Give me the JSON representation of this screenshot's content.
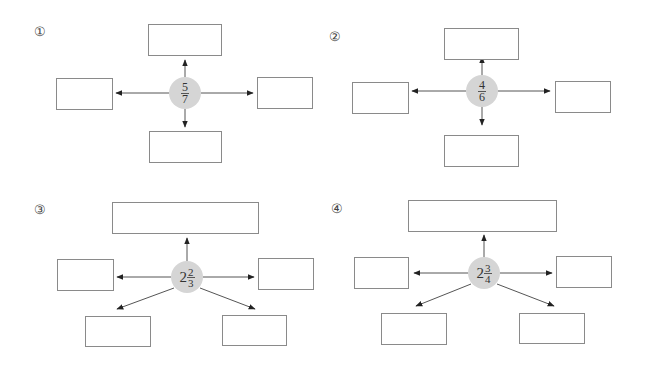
{
  "diagrams": [
    {
      "label": "①",
      "center": {
        "whole": "",
        "numerator": "5",
        "denominator": "7"
      },
      "boxes": [
        "",
        "",
        "",
        ""
      ],
      "layout": "cross"
    },
    {
      "label": "②",
      "center": {
        "whole": "",
        "numerator": "4",
        "denominator": "6"
      },
      "boxes": [
        "",
        "",
        "",
        ""
      ],
      "layout": "cross"
    },
    {
      "label": "③",
      "center": {
        "whole": "2",
        "numerator": "2",
        "denominator": "3"
      },
      "boxes": [
        "",
        "",
        "",
        "",
        ""
      ],
      "layout": "star"
    },
    {
      "label": "④",
      "center": {
        "whole": "2",
        "numerator": "3",
        "denominator": "4"
      },
      "boxes": [
        "",
        "",
        "",
        "",
        ""
      ],
      "layout": "star"
    }
  ],
  "colors": {
    "hub_fill": "#d5d5d5",
    "box_border": "#8a8a8a",
    "arrow": "#333333"
  }
}
